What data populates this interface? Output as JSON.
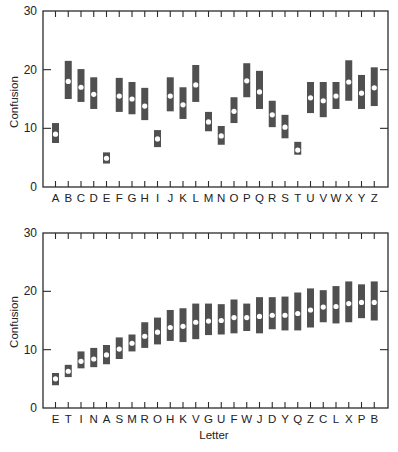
{
  "chart_data": [
    {
      "type": "range-bar",
      "title": "",
      "xlabel": "",
      "ylabel": "Confusion",
      "ylim": [
        0,
        30
      ],
      "yticks": [
        0,
        10,
        20,
        30
      ],
      "grid": false,
      "legend": null,
      "categories": [
        "A",
        "B",
        "C",
        "D",
        "E",
        "F",
        "G",
        "H",
        "I",
        "J",
        "K",
        "L",
        "M",
        "N",
        "O",
        "P",
        "Q",
        "R",
        "S",
        "T",
        "U",
        "V",
        "W",
        "X",
        "Y",
        "Z"
      ],
      "series": [
        {
          "name": "mean",
          "values": [
            9.0,
            18.0,
            17.0,
            15.8,
            4.9,
            15.5,
            15.0,
            13.8,
            8.2,
            15.5,
            14.0,
            17.4,
            11.1,
            8.7,
            12.9,
            18.1,
            16.2,
            12.3,
            10.2,
            6.3,
            15.2,
            14.7,
            15.5,
            17.9,
            16.0,
            16.9
          ]
        },
        {
          "name": "upper",
          "values": [
            10.9,
            21.5,
            20.1,
            18.7,
            5.9,
            18.6,
            17.9,
            16.9,
            9.7,
            18.7,
            17.0,
            20.8,
            12.8,
            10.4,
            15.3,
            21.1,
            19.8,
            14.7,
            12.3,
            7.7,
            17.9,
            17.9,
            17.9,
            21.6,
            19.1,
            20.4
          ]
        },
        {
          "name": "lower",
          "values": [
            7.5,
            15.0,
            14.5,
            13.3,
            4.0,
            12.8,
            12.4,
            11.4,
            6.8,
            12.9,
            11.6,
            14.5,
            9.5,
            7.2,
            10.9,
            15.3,
            13.3,
            10.2,
            8.3,
            5.5,
            12.6,
            11.9,
            13.3,
            14.7,
            13.3,
            13.8
          ]
        }
      ]
    },
    {
      "type": "range-bar",
      "title": "",
      "xlabel": "Letter",
      "ylabel": "Confusion",
      "ylim": [
        0,
        30
      ],
      "yticks": [
        0,
        10,
        20,
        30
      ],
      "grid": false,
      "legend": null,
      "categories": [
        "E",
        "T",
        "I",
        "N",
        "A",
        "S",
        "M",
        "R",
        "O",
        "H",
        "K",
        "V",
        "G",
        "U",
        "F",
        "W",
        "J",
        "D",
        "Y",
        "Q",
        "Z",
        "C",
        "L",
        "X",
        "P",
        "B"
      ],
      "series": [
        {
          "name": "mean",
          "values": [
            5.0,
            6.3,
            8.0,
            8.4,
            9.1,
            10.1,
            11.1,
            12.3,
            13.0,
            13.8,
            14.0,
            14.7,
            14.9,
            15.0,
            15.5,
            15.5,
            15.7,
            15.9,
            15.9,
            16.2,
            16.8,
            17.3,
            17.4,
            17.9,
            18.1,
            18.1
          ]
        },
        {
          "name": "upper",
          "values": [
            6.0,
            7.4,
            9.7,
            10.3,
            10.8,
            12.1,
            12.6,
            14.7,
            15.5,
            16.8,
            17.1,
            17.9,
            17.9,
            17.8,
            18.6,
            17.9,
            19.0,
            19.0,
            19.1,
            19.8,
            20.5,
            20.2,
            20.9,
            21.7,
            21.2,
            21.7
          ]
        },
        {
          "name": "lower",
          "values": [
            3.9,
            5.3,
            6.8,
            7.0,
            7.5,
            8.4,
            9.7,
            10.3,
            10.9,
            11.5,
            11.3,
            11.8,
            12.5,
            12.6,
            12.8,
            13.2,
            12.8,
            13.5,
            13.3,
            13.3,
            13.8,
            14.7,
            14.5,
            14.7,
            15.4,
            15.0
          ]
        }
      ]
    }
  ],
  "panels": [
    {
      "ylabel": "Confusion",
      "ytick_labels": [
        "0",
        "10",
        "20",
        "30"
      ],
      "xlabel": ""
    },
    {
      "ylabel": "Confusion",
      "ytick_labels": [
        "0",
        "10",
        "20",
        "30"
      ],
      "xlabel": "Letter"
    }
  ],
  "colors": {
    "bar": "#505050",
    "dot": "#ffffff",
    "axis": "#2b2b2b",
    "text": "#222222"
  }
}
